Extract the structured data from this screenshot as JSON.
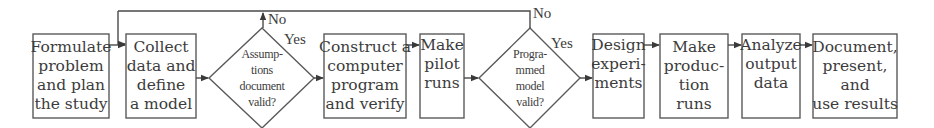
{
  "diagram": {
    "type": "flowchart",
    "colors": {
      "stroke": "#5a5a5a",
      "text": "#3c3c3c",
      "background": "#ffffff"
    },
    "nodes": [
      {
        "id": "formulate",
        "shape": "rect",
        "lines": [
          "Formulate",
          "problem",
          "and plan",
          "the study"
        ]
      },
      {
        "id": "collect",
        "shape": "rect",
        "lines": [
          "Collect",
          "data and",
          "define",
          "a model"
        ]
      },
      {
        "id": "assumptions",
        "shape": "diamond",
        "lines": [
          "Assump-",
          "tions",
          "document",
          "valid?"
        ]
      },
      {
        "id": "construct",
        "shape": "rect",
        "lines": [
          "Construct a",
          "computer",
          "program",
          "and verify"
        ]
      },
      {
        "id": "pilot",
        "shape": "rect",
        "lines": [
          "Make",
          "pilot",
          "runs"
        ]
      },
      {
        "id": "programmed",
        "shape": "diamond",
        "lines": [
          "Progra-",
          "mmed",
          "model",
          "valid?"
        ]
      },
      {
        "id": "design",
        "shape": "rect",
        "lines": [
          "Design",
          "experi-",
          "ments"
        ]
      },
      {
        "id": "production",
        "shape": "rect",
        "lines": [
          "Make",
          "produc-",
          "tion",
          "runs"
        ]
      },
      {
        "id": "analyze",
        "shape": "rect",
        "lines": [
          "Analyze",
          "output",
          "data"
        ]
      },
      {
        "id": "document",
        "shape": "rect",
        "lines": [
          "Document,",
          "present,",
          "and",
          "use results"
        ]
      }
    ],
    "edge_labels": {
      "assumptions_no": "No",
      "assumptions_yes": "Yes",
      "programmed_no": "No",
      "programmed_yes": "Yes"
    },
    "edges": [
      {
        "from": "formulate",
        "to": "collect"
      },
      {
        "from": "collect",
        "to": "assumptions"
      },
      {
        "from": "assumptions",
        "to": "construct",
        "label": "Yes"
      },
      {
        "from": "assumptions",
        "to": "collect",
        "label": "No",
        "route": "loop-top"
      },
      {
        "from": "construct",
        "to": "pilot"
      },
      {
        "from": "pilot",
        "to": "programmed"
      },
      {
        "from": "programmed",
        "to": "design",
        "label": "Yes"
      },
      {
        "from": "programmed",
        "to": "collect",
        "label": "No",
        "route": "loop-top"
      },
      {
        "from": "design",
        "to": "production"
      },
      {
        "from": "production",
        "to": "analyze"
      },
      {
        "from": "analyze",
        "to": "document"
      }
    ]
  }
}
